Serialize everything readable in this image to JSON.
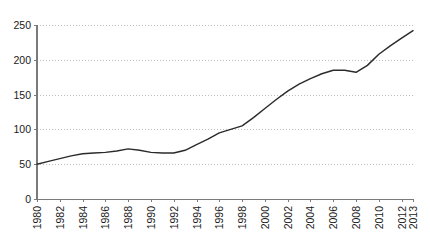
{
  "chart_data": {
    "type": "line",
    "title": "",
    "subtitle": "",
    "xlabel": "",
    "ylabel": "",
    "xlim": [
      1980,
      2013
    ],
    "ylim": [
      0,
      250
    ],
    "grid": true,
    "grid_axis": "y",
    "legend": false,
    "legend_position": "none",
    "line_color": "#2b2b2b",
    "gridline_color": "#bdbdbd",
    "axis_color": "#7a7a7a",
    "background_color": "#ffffff",
    "y_ticks": [
      0,
      50,
      100,
      150,
      200,
      250
    ],
    "y_tick_labels": [
      "0",
      "50",
      "100",
      "150",
      "200",
      "250"
    ],
    "x_tick_labels": [
      "1980",
      "1982",
      "1984",
      "1986",
      "1988",
      "1990",
      "1992",
      "1994",
      "1996",
      "1998",
      "2000",
      "2002",
      "2004",
      "2006",
      "2008",
      "2010",
      "2012",
      "2013"
    ],
    "x_tick_values": [
      1980,
      1982,
      1984,
      1986,
      1988,
      1990,
      1992,
      1994,
      1996,
      1998,
      2000,
      2002,
      2004,
      2006,
      2008,
      2010,
      2012,
      2013
    ],
    "x_tick_rotation": -90,
    "series": [
      {
        "name": "series-1",
        "color": "#2b2b2b",
        "x": [
          1980,
          1981,
          1982,
          1983,
          1984,
          1985,
          1986,
          1987,
          1988,
          1989,
          1990,
          1991,
          1992,
          1993,
          1994,
          1995,
          1996,
          1997,
          1998,
          1999,
          2000,
          2001,
          2002,
          2003,
          2004,
          2005,
          2006,
          2007,
          2008,
          2009,
          2010,
          2011,
          2012,
          2013
        ],
        "values": [
          50,
          54,
          58,
          62,
          65,
          66,
          67,
          69,
          72,
          70,
          67,
          66,
          66,
          70,
          78,
          86,
          95,
          100,
          105,
          117,
          130,
          143,
          155,
          165,
          173,
          180,
          185,
          185,
          182,
          192,
          208,
          220,
          231,
          242
        ]
      }
    ]
  }
}
